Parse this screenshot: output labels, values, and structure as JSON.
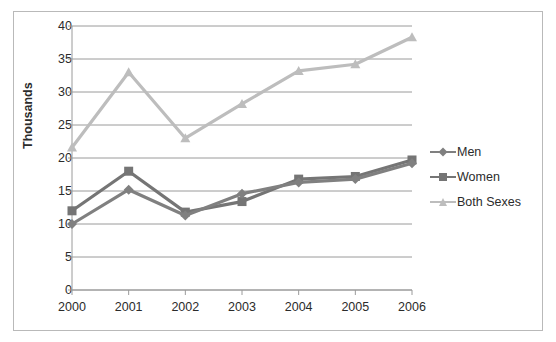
{
  "chart_data": {
    "type": "line",
    "title": "",
    "xlabel": "",
    "ylabel": "Thousands",
    "categories": [
      "2000",
      "2001",
      "2002",
      "2003",
      "2004",
      "2005",
      "2006"
    ],
    "x": [
      2000,
      2001,
      2002,
      2003,
      2004,
      2005,
      2006
    ],
    "series": [
      {
        "name": "Men",
        "marker": "diamond",
        "color": "#808080",
        "values": [
          10.0,
          15.2,
          11.3,
          14.6,
          16.3,
          16.8,
          19.2
        ]
      },
      {
        "name": "Women",
        "marker": "square",
        "color": "#757575",
        "values": [
          12.0,
          18.0,
          11.8,
          13.4,
          16.8,
          17.2,
          19.7
        ]
      },
      {
        "name": "Both Sexes",
        "marker": "triangle",
        "color": "#bdbdbd",
        "values": [
          21.6,
          33.0,
          23.0,
          28.2,
          33.2,
          34.2,
          38.3
        ]
      }
    ],
    "ylim": [
      0,
      40
    ],
    "yticks": [
      0,
      5,
      10,
      15,
      20,
      25,
      30,
      35,
      40
    ],
    "ytick_labels": [
      "0",
      "5",
      "10",
      "15",
      "20",
      "25",
      "30",
      "35",
      "40"
    ],
    "grid": true,
    "grid_axis": "y",
    "legend_position": "right",
    "legend_entries": [
      "Men",
      "Women",
      "Both Sexes"
    ],
    "colors": {
      "men": "#808080",
      "women": "#757575",
      "both_sexes": "#bdbdbd",
      "gridline": "#9a9a9a",
      "axis": "#9a9a9a",
      "text": "#2b2b2b",
      "frame": "#b9b9b9",
      "background": "#ffffff"
    }
  },
  "axis": {
    "y_title": "Thousands"
  }
}
